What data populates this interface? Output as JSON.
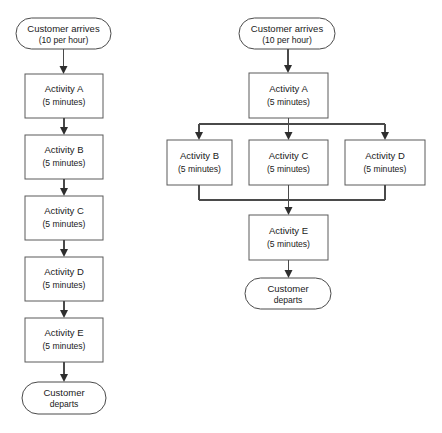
{
  "diagram": {
    "type": "flowchart",
    "background_color": "#ffffff",
    "stroke_color": "#4a4a4a",
    "text_color": "#1a1a1a",
    "panels": [
      {
        "id": "sequential-process",
        "layout": "serial",
        "nodes": [
          {
            "id": "left-start",
            "shape": "terminator",
            "label": "Customer arrives",
            "sublabel": "(10 per hour)"
          },
          {
            "id": "left-activity-a",
            "shape": "process",
            "label": "Activity A",
            "sublabel": "(5 minutes)"
          },
          {
            "id": "left-activity-b",
            "shape": "process",
            "label": "Activity B",
            "sublabel": "(5 minutes)"
          },
          {
            "id": "left-activity-c",
            "shape": "process",
            "label": "Activity C",
            "sublabel": "(5 minutes)"
          },
          {
            "id": "left-activity-d",
            "shape": "process",
            "label": "Activity D",
            "sublabel": "(5 minutes)"
          },
          {
            "id": "left-activity-e",
            "shape": "process",
            "label": "Activity E",
            "sublabel": "(5 minutes)"
          },
          {
            "id": "left-end",
            "shape": "terminator",
            "label": "Customer",
            "sublabel": "departs"
          }
        ]
      },
      {
        "id": "parallel-process",
        "layout": "parallel",
        "nodes": [
          {
            "id": "right-start",
            "shape": "terminator",
            "label": "Customer arrives",
            "sublabel": "(10 per hour)"
          },
          {
            "id": "right-activity-a",
            "shape": "process",
            "label": "Activity A",
            "sublabel": "(5 minutes)"
          },
          {
            "id": "right-activity-b",
            "shape": "process",
            "label": "Activity B",
            "sublabel": "(5 minutes)"
          },
          {
            "id": "right-activity-c",
            "shape": "process",
            "label": "Activity C",
            "sublabel": "(5 minutes)"
          },
          {
            "id": "right-activity-d",
            "shape": "process",
            "label": "Activity D",
            "sublabel": "(5 minutes)"
          },
          {
            "id": "right-activity-e",
            "shape": "process",
            "label": "Activity E",
            "sublabel": "(5 minutes)"
          },
          {
            "id": "right-end",
            "shape": "terminator",
            "label": "Customer",
            "sublabel": "departs"
          }
        ]
      }
    ]
  }
}
